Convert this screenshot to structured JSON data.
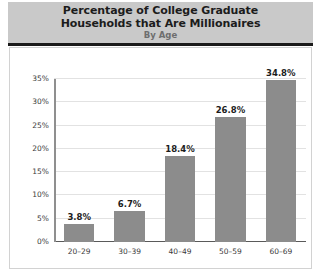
{
  "header": {
    "title_line_1": "Percentage of College Graduate",
    "title_line_2": "Households that Are Millionaires",
    "subtitle": "By Age"
  },
  "colors": {
    "bar": "#8c8c8c",
    "header_band": "#c9c9c9",
    "rule": "#1a1a1a",
    "gridline": "#e2e2e2",
    "axis": "#5a5a5a"
  },
  "chart_data": {
    "type": "bar",
    "title": "Percentage of College Graduate Households that Are Millionaires",
    "subtitle": "By Age",
    "xlabel": "",
    "ylabel": "",
    "categories": [
      "20–29",
      "30–39",
      "40–49",
      "50–59",
      "60–69"
    ],
    "values": [
      3.8,
      6.7,
      18.4,
      26.8,
      34.8
    ],
    "data_labels": [
      "3.8%",
      "6.7%",
      "18.4%",
      "26.8%",
      "34.8%"
    ],
    "ylim": [
      0,
      35
    ],
    "yticks": [
      0,
      5,
      10,
      15,
      20,
      25,
      30,
      35
    ],
    "ytick_labels": [
      "0%",
      "5%",
      "10%",
      "15%",
      "20%",
      "25%",
      "30%",
      "35%"
    ],
    "grid": true,
    "legend": false
  }
}
